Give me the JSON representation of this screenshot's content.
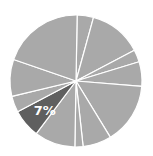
{
  "chart_data": {
    "type": "pie",
    "title": "",
    "start_angle_deg": 1,
    "direction": "clockwise",
    "center": [
      76,
      81
    ],
    "radius": 66,
    "separator_color": "#ffffff",
    "base_color": "#a9a9a9",
    "highlight_color": "#5f5f5f",
    "slices": [
      {
        "value": 4,
        "highlight": false,
        "label": ""
      },
      {
        "value": 13,
        "highlight": false,
        "label": ""
      },
      {
        "value": 3,
        "highlight": false,
        "label": ""
      },
      {
        "value": 6,
        "highlight": false,
        "label": ""
      },
      {
        "value": 15,
        "highlight": false,
        "label": ""
      },
      {
        "value": 7,
        "highlight": false,
        "label": ""
      },
      {
        "value": 2,
        "highlight": false,
        "label": ""
      },
      {
        "value": 10,
        "highlight": false,
        "label": ""
      },
      {
        "value": 7,
        "highlight": true,
        "label": "7%"
      },
      {
        "value": 4,
        "highlight": false,
        "label": ""
      },
      {
        "value": 9,
        "highlight": false,
        "label": ""
      },
      {
        "value": 20,
        "highlight": false,
        "label": ""
      }
    ],
    "legend": "none"
  },
  "labels": {
    "highlight_label": "7%"
  }
}
